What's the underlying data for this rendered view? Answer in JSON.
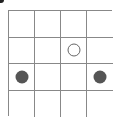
{
  "board": {
    "rows": 4,
    "cols": 4,
    "grid_color": "#888888",
    "stones": [
      {
        "row": 1,
        "col": 2,
        "type": "hollow",
        "color": "#666666"
      },
      {
        "row": 2,
        "col": 0,
        "type": "filled",
        "color": "#555555"
      },
      {
        "row": 2,
        "col": 3,
        "type": "filled",
        "color": "#555555"
      }
    ]
  }
}
